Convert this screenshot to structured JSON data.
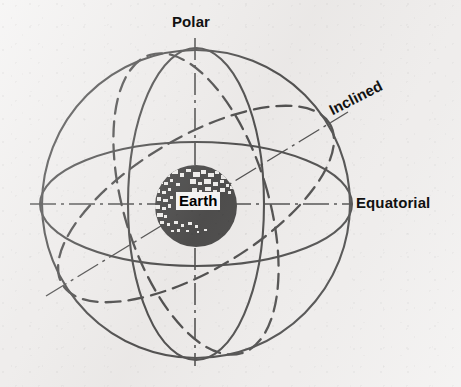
{
  "figure": {
    "background_color": "#efedec",
    "ink_color": "#101010"
  },
  "labels": {
    "polar": "Polar",
    "inclined": "Inclined",
    "equatorial": "Equatorial",
    "earth": "Earth"
  },
  "body": {
    "name": "Earth",
    "center_x": 196,
    "center_y": 206,
    "radius": 41,
    "fill": "#0b0b0b",
    "texture": "speckled-landmass"
  },
  "axes": [
    {
      "name": "polar-axis",
      "label": "Polar",
      "style": "dash-dot",
      "x1": 195,
      "y1": 38,
      "x2": 195,
      "y2": 366
    },
    {
      "name": "equatorial-axis",
      "label": "Equatorial",
      "style": "dash-dot",
      "x1": 30,
      "y1": 204,
      "x2": 352,
      "y2": 204
    },
    {
      "name": "inclined-axis",
      "label": "Inclined",
      "style": "dash-dot",
      "x1": 46,
      "y1": 296,
      "x2": 348,
      "y2": 112
    }
  ],
  "orbits": [
    {
      "name": "polar-orbit",
      "label": "Polar",
      "style": "solid",
      "shape": "ellipse",
      "rx": 68,
      "ry": 156,
      "rotation_deg": 0
    },
    {
      "name": "equatorial-orbit",
      "label": "Equatorial",
      "style": "solid",
      "shape": "ellipse",
      "rx": 156,
      "ry": 62,
      "rotation_deg": 0
    },
    {
      "name": "outer-circle-orbit",
      "label": "",
      "style": "solid",
      "shape": "circle",
      "rx": 154,
      "ry": 154,
      "rotation_deg": 0
    },
    {
      "name": "inclined-orbit",
      "label": "Inclined",
      "style": "dashed",
      "shape": "ellipse",
      "rx": 156,
      "ry": 66,
      "rotation_deg": -31
    },
    {
      "name": "inclined-orbit-secondary",
      "label": "Inclined",
      "style": "dashed",
      "shape": "ellipse",
      "rx": 72,
      "ry": 156,
      "rotation_deg": -17
    }
  ]
}
